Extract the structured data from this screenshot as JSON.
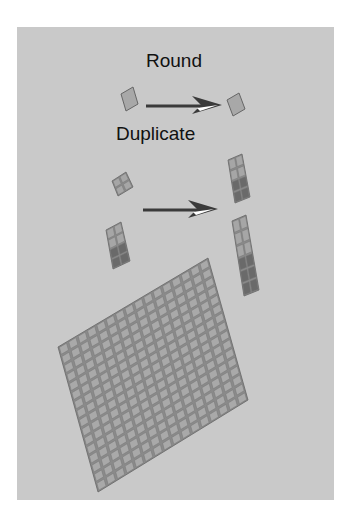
{
  "labels": {
    "round": "Round",
    "duplicate": "Duplicate"
  },
  "colors": {
    "background": "#ffffff",
    "panel": "#c9c9c9",
    "tile_light": "#a6a6a6",
    "tile_dark": "#6a6a6a",
    "tile_stroke": "#555555",
    "arrow": "#3a3a3a",
    "arrow_highlight": "#ffffff"
  },
  "diagram": {
    "steps": [
      {
        "name": "round",
        "from": "single tile",
        "to": "single tile"
      },
      {
        "name": "duplicate",
        "from": [
          "2x2 block",
          "2x4 column"
        ],
        "to": [
          "2x4 column",
          "2x6 column"
        ]
      }
    ],
    "grid": {
      "rows": 16,
      "cols": 16
    }
  }
}
